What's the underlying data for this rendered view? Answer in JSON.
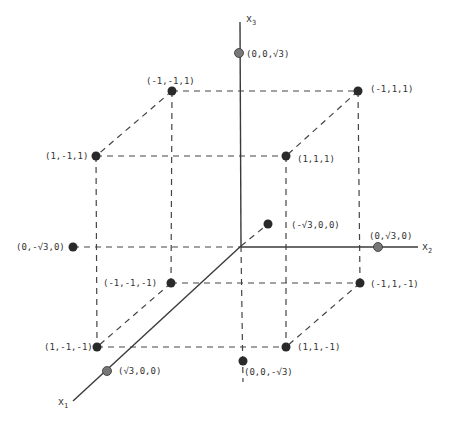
{
  "diagram": {
    "type": "3d-coordinate-diagram",
    "axes": {
      "x1": {
        "label": "x",
        "subscript": "1"
      },
      "x2": {
        "label": "x",
        "subscript": "2"
      },
      "x3": {
        "label": "x",
        "subscript": "3"
      }
    },
    "cube_vertices": [
      {
        "label": "(-1,-1,1)"
      },
      {
        "label": "(-1,1,1)"
      },
      {
        "label": "(1,-1,1)"
      },
      {
        "label": "(1,1,1)"
      },
      {
        "label": "(-1,-1,-1)"
      },
      {
        "label": "(-1,1,-1)"
      },
      {
        "label": "(1,-1,-1)"
      },
      {
        "label": "(1,1,-1)"
      }
    ],
    "axis_points": [
      {
        "label": "(0,0,√3)"
      },
      {
        "label": "(0,0,-√3)"
      },
      {
        "label": "(0,√3,0)"
      },
      {
        "label": "(0,-√3,0)"
      },
      {
        "label": "(√3,0,0)"
      },
      {
        "label": "(-√3,0,0)"
      }
    ],
    "colors": {
      "axis": "#3a3a3a",
      "dashed": "#444444",
      "vertex": "#2a2a2a",
      "axis_point": "#777777"
    }
  }
}
